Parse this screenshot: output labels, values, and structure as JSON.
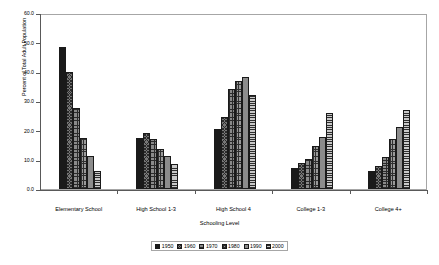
{
  "chart_data": {
    "type": "bar",
    "title": "",
    "subtitle": "",
    "xlabel": "Schooling Level",
    "ylabel": "Percent of Total Adult Population",
    "ylim": [
      0.0,
      60.0
    ],
    "y_ticks": [
      "0.0",
      "10.0",
      "20.0",
      "30.0",
      "40.0",
      "50.0",
      "60.0"
    ],
    "y_tick_values": [
      0.0,
      10.0,
      20.0,
      30.0,
      40.0,
      50.0,
      60.0
    ],
    "grid": false,
    "legend_position": "bottom",
    "categories": [
      "Elementary School",
      "High School 1-3",
      "High School 4",
      "College 1-3",
      "College 4+"
    ],
    "series": [
      {
        "name": "1950",
        "values": [
          48.5,
          17.4,
          20.6,
          7.3,
          6.2
        ]
      },
      {
        "name": "1960",
        "values": [
          39.8,
          19.2,
          24.4,
          8.7,
          7.7
        ]
      },
      {
        "name": "1970",
        "values": [
          27.7,
          17.0,
          34.0,
          10.2,
          11.0
        ]
      },
      {
        "name": "1980",
        "values": [
          17.5,
          13.7,
          36.7,
          14.8,
          16.9
        ]
      },
      {
        "name": "1990",
        "values": [
          11.2,
          11.1,
          38.3,
          17.9,
          21.2
        ]
      },
      {
        "name": "2000",
        "values": [
          6.3,
          8.6,
          32.2,
          26.0,
          26.8
        ]
      }
    ],
    "series_fills": [
      "solid-black",
      "diagonal-crosshatch",
      "fine-grid-dots",
      "coarse-grid-dots",
      "solid-gray",
      "horizontal-lines"
    ],
    "colors": {
      "series_1950": "#1a1a1a",
      "series_1960": "#777777",
      "series_1970": "#8a8a8a",
      "series_1980": "#9a9a9a",
      "series_1990": "#8c8c8c",
      "series_2000": "#c9c9c9",
      "axis": "#595959",
      "frame": "#a6a6a6",
      "background": "#ffffff"
    }
  }
}
